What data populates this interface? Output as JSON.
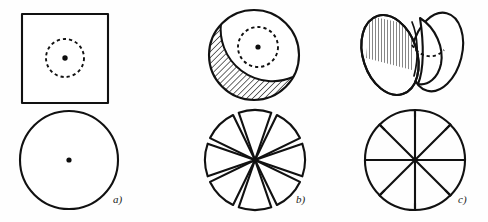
{
  "figure": {
    "background_color": "#fefefe",
    "ink_color": "#111111",
    "width": 488,
    "height": 222,
    "panels": [
      {
        "id": "a",
        "label": "a)",
        "label_x": 113,
        "label_y": 203,
        "top_shape": {
          "name": "square-with-dashed-circle",
          "kind": "square",
          "x": 22,
          "y": 14,
          "width": 86,
          "height": 89,
          "inner_dashed_circle": {
            "cx": 65,
            "cy": 58,
            "r": 19,
            "dash_count": 16
          },
          "center_dot": {
            "cx": 65,
            "cy": 58,
            "r": 2.7
          }
        },
        "bottom_shape": {
          "name": "plain-circle",
          "kind": "circle",
          "cx": 69,
          "cy": 160,
          "r": 49,
          "center_dot": {
            "cx": 69,
            "cy": 160,
            "r": 2.6
          }
        }
      },
      {
        "id": "b",
        "label": "b)",
        "label_x": 296,
        "label_y": 203,
        "top_shape": {
          "name": "circle-with-hatched-crescent",
          "kind": "circle",
          "cx": 254,
          "cy": 55,
          "r": 45,
          "hatch_angle_deg": 45,
          "hatch_region": "lower-left-crescent",
          "inner_dashed_circle": {
            "cx": 258,
            "cy": 47,
            "r": 20,
            "dash_count": 16
          },
          "center_dot": {
            "cx": 258,
            "cy": 47,
            "r": 2.6
          }
        },
        "bottom_shape": {
          "name": "eight-petal-pinwheel",
          "kind": "pinwheel-petals",
          "cx": 255,
          "cy": 160,
          "r": 50,
          "petal_count": 8,
          "petal_half_angle_deg": 19,
          "skew_deg": 13
        }
      },
      {
        "id": "c",
        "label": "c)",
        "label_x": 458,
        "label_y": 203,
        "top_shape": {
          "name": "folded-bilobed-shell",
          "kind": "two-lobes",
          "cx": 412,
          "cy": 54,
          "left_lobe": {
            "cx": 390,
            "cy": 55,
            "rx": 27,
            "ry": 41,
            "rot_deg": -18
          },
          "right_lobe": {
            "cx": 437,
            "cy": 52,
            "rx": 25,
            "ry": 40,
            "rot_deg": 14
          },
          "hatch_region": "left-lobe-upper",
          "hatch_angle_deg": 90,
          "dashed_arc": "inner-fold-curve"
        },
        "bottom_shape": {
          "name": "spoked-ratchet-disc",
          "kind": "spoked-disc",
          "cx": 415,
          "cy": 160,
          "r": 50,
          "spoke_count": 8,
          "arc_offset_deg": 13
        }
      }
    ]
  }
}
